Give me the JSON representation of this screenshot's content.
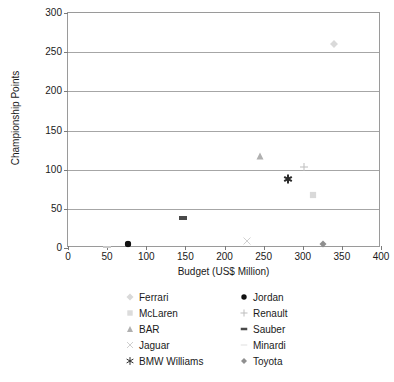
{
  "chart_data": {
    "type": "scatter",
    "title": "",
    "xlabel": "Budget (US$ Million)",
    "ylabel": "Championship Points",
    "xlim": [
      0,
      400
    ],
    "ylim": [
      0,
      300
    ],
    "xticks": [
      0,
      50,
      100,
      150,
      200,
      250,
      300,
      350,
      400
    ],
    "yticks": [
      0,
      50,
      100,
      150,
      200,
      250,
      300
    ],
    "grid": "horizontal",
    "legend_position": "bottom",
    "series": [
      {
        "name": "Ferrari",
        "marker": "diamond-plus",
        "color": "#d9d9d9",
        "x": 340,
        "y": 260
      },
      {
        "name": "McLaren",
        "marker": "square",
        "color": "#d9d9d9",
        "x": 313,
        "y": 68
      },
      {
        "name": "BAR",
        "marker": "triangle",
        "color": "#b0b0b0",
        "x": 245,
        "y": 117
      },
      {
        "name": "Jaguar",
        "marker": "cross-x",
        "color": "#d0d0d0",
        "x": 229,
        "y": 9
      },
      {
        "name": "BMW Williams",
        "marker": "asterisk",
        "color": "#2b2b2b",
        "x": 281,
        "y": 88
      },
      {
        "name": "Jordan",
        "marker": "circle",
        "color": "#111111",
        "x": 77,
        "y": 5
      },
      {
        "name": "Renault",
        "marker": "plus",
        "color": "#bdbdbd",
        "x": 301,
        "y": 103
      },
      {
        "name": "Sauber",
        "marker": "dash",
        "color": "#4a4a4a",
        "x": 147,
        "y": 38
      },
      {
        "name": "Minardi",
        "marker": "dash-thin",
        "color": "#c8c8c8",
        "x": 50,
        "y": 1
      },
      {
        "name": "Toyota",
        "marker": "diamond",
        "color": "#8f8f8f",
        "x": 326,
        "y": 5
      }
    ]
  },
  "axes": {
    "x_title": "Budget (US$ Million)",
    "y_title": "Championship Points",
    "x_tick_labels": [
      "0",
      "50",
      "100",
      "150",
      "200",
      "250",
      "300",
      "350",
      "400"
    ],
    "y_tick_labels": [
      "0",
      "50",
      "100",
      "150",
      "200",
      "250",
      "300"
    ]
  },
  "legend": {
    "left_column": [
      {
        "label": "Ferrari",
        "marker": "diamond-plus",
        "color": "#d9d9d9"
      },
      {
        "label": "McLaren",
        "marker": "square",
        "color": "#dcdcdc"
      },
      {
        "label": "BAR",
        "marker": "triangle",
        "color": "#b0b0b0"
      },
      {
        "label": "Jaguar",
        "marker": "cross-x",
        "color": "#cfcfcf"
      },
      {
        "label": "BMW Williams",
        "marker": "asterisk",
        "color": "#2b2b2b"
      }
    ],
    "right_column": [
      {
        "label": "Jordan",
        "marker": "circle",
        "color": "#111111"
      },
      {
        "label": "Renault",
        "marker": "plus",
        "color": "#bdbdbd"
      },
      {
        "label": "Sauber",
        "marker": "dash",
        "color": "#4a4a4a"
      },
      {
        "label": "Minardi",
        "marker": "dash-thin",
        "color": "#bfbfbf"
      },
      {
        "label": "Toyota",
        "marker": "diamond",
        "color": "#8f8f8f"
      }
    ]
  },
  "colors": {
    "background": "#ffffff",
    "gridline": "#a6a6a6",
    "frame": "#9a9a9a",
    "text": "#1a1a1a"
  }
}
